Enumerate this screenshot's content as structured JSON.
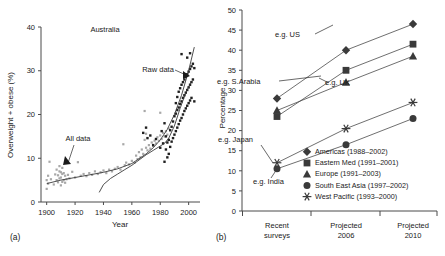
{
  "figure": {
    "panel_a_label": "(a)",
    "panel_b_label": "(b)"
  },
  "chart_data": [
    {
      "type": "scatter",
      "panel": "(a)",
      "title": "Australia",
      "xlabel": "Year",
      "ylabel": "Overweight + obese (%)",
      "xlim": [
        1896,
        2008
      ],
      "ylim": [
        0,
        40
      ],
      "xticks": [
        1900,
        1920,
        1940,
        1960,
        1980,
        2000
      ],
      "yticks": [
        0,
        10,
        20,
        30,
        40
      ],
      "grid": false,
      "legend_position": "none",
      "annotations": [
        {
          "text": "Australia",
          "x": 1948,
          "y": 37
        },
        {
          "text": "Raw data",
          "x": 1973,
          "y": 30.5
        },
        {
          "text": "All data",
          "x": 1932,
          "y": 11.5
        }
      ],
      "series": [
        {
          "name": "All data",
          "marker": "open-circle",
          "color": "#a8a8a8",
          "points": [
            [
              1900,
              3.0
            ],
            [
              1900,
              5.0
            ],
            [
              1901,
              4.2
            ],
            [
              1901,
              6.0
            ],
            [
              1902,
              9.2
            ],
            [
              1903,
              5.2
            ],
            [
              1905,
              4.0
            ],
            [
              1906,
              6.3
            ],
            [
              1907,
              5.0
            ],
            [
              1907,
              7.4
            ],
            [
              1908,
              4.5
            ],
            [
              1908,
              6.1
            ],
            [
              1909,
              5.4
            ],
            [
              1909,
              7.0
            ],
            [
              1909,
              8.2
            ],
            [
              1910,
              3.8
            ],
            [
              1910,
              5.6
            ],
            [
              1910,
              6.8
            ],
            [
              1911,
              4.6
            ],
            [
              1911,
              6.4
            ],
            [
              1911,
              7.8
            ],
            [
              1912,
              5.0
            ],
            [
              1912,
              6.6
            ],
            [
              1913,
              4.4
            ],
            [
              1913,
              6.0
            ],
            [
              1914,
              5.2
            ],
            [
              1915,
              6.2
            ],
            [
              1916,
              5.4
            ],
            [
              1918,
              6.9
            ],
            [
              1920,
              5.6
            ],
            [
              1922,
              9.1
            ],
            [
              1924,
              6.0
            ],
            [
              1926,
              6.4
            ],
            [
              1928,
              5.9
            ],
            [
              1930,
              6.6
            ],
            [
              1932,
              6.2
            ],
            [
              1934,
              7.0
            ],
            [
              1936,
              6.4
            ],
            [
              1938,
              6.8
            ],
            [
              1940,
              7.2
            ],
            [
              1942,
              6.6
            ],
            [
              1944,
              7.4
            ],
            [
              1946,
              7.0
            ],
            [
              1948,
              7.6
            ],
            [
              1950,
              8.0
            ],
            [
              1952,
              7.4
            ],
            [
              1954,
              13.2
            ],
            [
              1955,
              8.4
            ],
            [
              1956,
              9.0
            ],
            [
              1958,
              8.6
            ],
            [
              1960,
              9.4
            ],
            [
              1962,
              9.0
            ],
            [
              1963,
              10.6
            ],
            [
              1964,
              9.8
            ],
            [
              1965,
              11.4
            ],
            [
              1966,
              10.2
            ],
            [
              1967,
              12.0
            ],
            [
              1968,
              11.0
            ],
            [
              1969,
              14.2
            ],
            [
              1969,
              20.8
            ],
            [
              1970,
              12.4
            ],
            [
              1970,
              15.6
            ],
            [
              1971,
              11.8
            ],
            [
              1972,
              13.0
            ],
            [
              1973,
              12.2
            ],
            [
              1974,
              13.6
            ],
            [
              1975,
              12.8
            ],
            [
              1976,
              14.0
            ],
            [
              1977,
              13.4
            ],
            [
              1978,
              14.8
            ],
            [
              1979,
              14.0
            ],
            [
              1980,
              15.2
            ],
            [
              1980,
              20.4
            ],
            [
              1981,
              14.4
            ],
            [
              1982,
              15.8
            ],
            [
              1983,
              15.0
            ],
            [
              1984,
              16.2
            ],
            [
              1985,
              15.4
            ],
            [
              1986,
              16.8
            ]
          ]
        },
        {
          "name": "Raw data",
          "marker": "filled-square",
          "color": "#1f1f1f",
          "points": [
            [
              1968,
              15.8
            ],
            [
              1970,
              17.0
            ],
            [
              1971,
              14.6
            ],
            [
              1973,
              15.2
            ],
            [
              1975,
              13.0
            ],
            [
              1977,
              14.4
            ],
            [
              1980,
              12.4
            ],
            [
              1981,
              16.2
            ],
            [
              1982,
              13.4
            ],
            [
              1983,
              9.2
            ],
            [
              1983,
              18.0
            ],
            [
              1984,
              12.0
            ],
            [
              1984,
              15.0
            ],
            [
              1985,
              10.2
            ],
            [
              1985,
              13.6
            ],
            [
              1986,
              11.0
            ],
            [
              1986,
              14.2
            ],
            [
              1987,
              12.6
            ],
            [
              1987,
              16.4
            ],
            [
              1988,
              13.8
            ],
            [
              1988,
              17.2
            ],
            [
              1989,
              14.6
            ],
            [
              1989,
              18.4
            ],
            [
              1990,
              15.4
            ],
            [
              1990,
              19.6
            ],
            [
              1991,
              16.2
            ],
            [
              1991,
              20.2
            ],
            [
              1991,
              22.6
            ],
            [
              1992,
              17.0
            ],
            [
              1992,
              21.0
            ],
            [
              1992,
              24.0
            ],
            [
              1993,
              17.8
            ],
            [
              1993,
              21.6
            ],
            [
              1993,
              25.2
            ],
            [
              1994,
              18.6
            ],
            [
              1994,
              22.4
            ],
            [
              1994,
              26.0
            ],
            [
              1995,
              19.2
            ],
            [
              1995,
              23.0
            ],
            [
              1995,
              26.8
            ],
            [
              1995,
              33.8
            ],
            [
              1996,
              20.0
            ],
            [
              1996,
              23.8
            ],
            [
              1996,
              27.4
            ],
            [
              1997,
              20.8
            ],
            [
              1997,
              24.4
            ],
            [
              1997,
              28.0
            ],
            [
              1998,
              21.4
            ],
            [
              1998,
              25.0
            ],
            [
              1998,
              28.6
            ],
            [
              1999,
              22.0
            ],
            [
              1999,
              25.6
            ],
            [
              1999,
              29.2
            ],
            [
              2000,
              22.6
            ],
            [
              2000,
              26.2
            ],
            [
              2000,
              29.8
            ],
            [
              2001,
              23.2
            ],
            [
              2001,
              26.8
            ],
            [
              2001,
              30.4
            ],
            [
              2002,
              23.8
            ],
            [
              2002,
              27.4
            ],
            [
              2002,
              31.0
            ],
            [
              2003,
              28.0
            ],
            [
              2003,
              31.6
            ],
            [
              2004,
              30.6
            ],
            [
              2004,
              23.0
            ],
            [
              1999,
              33.0
            ],
            [
              2001,
              34.0
            ]
          ]
        }
      ],
      "trend_curves": [
        {
          "name": "all-data-trend",
          "points": [
            [
              1900,
              4.2
            ],
            [
              1910,
              5.0
            ],
            [
              1920,
              5.6
            ],
            [
              1930,
              6.2
            ],
            [
              1940,
              6.8
            ],
            [
              1950,
              7.6
            ],
            [
              1960,
              8.8
            ],
            [
              1970,
              11.0
            ],
            [
              1975,
              12.4
            ],
            [
              1980,
              14.2
            ],
            [
              1985,
              16.6
            ],
            [
              1990,
              20.0
            ],
            [
              1995,
              24.4
            ],
            [
              2000,
              30.0
            ],
            [
              2004,
              35.4
            ]
          ]
        },
        {
          "name": "raw-data-trend",
          "points": [
            [
              1937,
              2.2
            ],
            [
              1940,
              4.0
            ],
            [
              1945,
              5.4
            ],
            [
              1950,
              6.4
            ],
            [
              1955,
              7.4
            ],
            [
              1960,
              8.4
            ],
            [
              1965,
              9.6
            ],
            [
              1970,
              10.8
            ],
            [
              1975,
              11.8
            ],
            [
              1980,
              12.8
            ],
            [
              1983,
              13.4
            ],
            [
              1986,
              14.6
            ],
            [
              1990,
              17.4
            ],
            [
              1994,
              21.4
            ],
            [
              1998,
              25.0
            ],
            [
              2002,
              27.6
            ]
          ]
        }
      ]
    },
    {
      "type": "line",
      "panel": "(b)",
      "title": "",
      "xlabel": "",
      "ylabel": "Percentage",
      "categories": [
        "Recent surveys",
        "Projected 2006",
        "Projected 2010"
      ],
      "category_lines": [
        [
          "Recent",
          "surveys"
        ],
        [
          "Projected",
          "2006"
        ],
        [
          "Projected",
          "2010"
        ]
      ],
      "ylim": [
        0,
        50
      ],
      "yticks": [
        0,
        5,
        10,
        15,
        20,
        25,
        30,
        35,
        40,
        45,
        50
      ],
      "grid": false,
      "legend_position": "lower-right",
      "series": [
        {
          "name": "Americas (1988–2002)",
          "marker": "diamond",
          "values": [
            28.0,
            40.0,
            46.5
          ]
        },
        {
          "name": "Eastern Med (1991–2001)",
          "marker": "square",
          "values": [
            23.5,
            35.0,
            41.5
          ]
        },
        {
          "name": "Europe (1991–2003)",
          "marker": "triangle",
          "values": [
            25.0,
            32.0,
            38.5
          ]
        },
        {
          "name": "South East Asia (1997–2002)",
          "marker": "circle",
          "values": [
            10.5,
            16.5,
            23.0
          ]
        },
        {
          "name": "West Pacific (1993–2000)",
          "marker": "asterisk",
          "values": [
            12.0,
            20.5,
            27.0
          ]
        }
      ],
      "annotations": [
        {
          "text": "e.g. US",
          "target_series": "Americas (1988–2002)"
        },
        {
          "text": "e.g. S.Arabia",
          "target_series": "Eastern Med (1991–2001)"
        },
        {
          "text": "e.g. UK",
          "target_series": "Europe (1991–2003)"
        },
        {
          "text": "e.g. Japan",
          "target_series": "West Pacific (1993–2000)"
        },
        {
          "text": "e.g. India",
          "target_series": "South East Asia (1997–2002)"
        }
      ]
    }
  ]
}
